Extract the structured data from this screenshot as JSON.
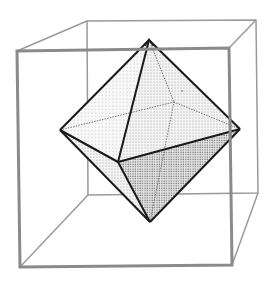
{
  "diagram": {
    "colors": {
      "background": "#ffffff",
      "cube_front": "#8a8a8a",
      "cube_back": "#9a9a9a",
      "octa_edge": "#1a1a1a",
      "hidden_edge": "#7a7a7a",
      "face_light": "#f0f0f0",
      "face_mid": "#e2e2e2",
      "face_dark": "#c8c8c8"
    },
    "cube": {
      "front": {
        "tl": [
          17,
          51
        ],
        "tr": [
          229,
          48
        ],
        "br": [
          232,
          265
        ],
        "bl": [
          20,
          267
        ]
      },
      "back": {
        "tl": [
          87,
          21
        ],
        "tr": [
          256,
          20
        ],
        "br": [
          258,
          193
        ],
        "bl": [
          88,
          195
        ]
      }
    },
    "octahedron": {
      "top": [
        149,
        40
      ],
      "bottom": [
        150,
        222
      ],
      "left": [
        60,
        130
      ],
      "right": [
        240,
        129
      ],
      "front": [
        118,
        162
      ],
      "back": [
        174,
        102
      ]
    }
  }
}
